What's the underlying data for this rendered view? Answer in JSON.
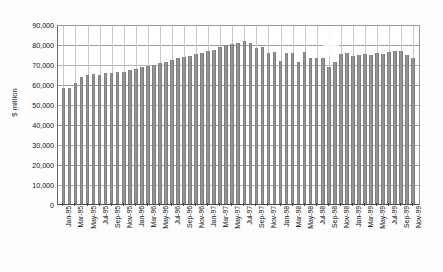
{
  "chart_data": {
    "type": "bar",
    "title": "",
    "xlabel": "",
    "ylabel": "$ million",
    "ylim": [
      0,
      90000
    ],
    "ytick_step": 10000,
    "ytick_labels": [
      "90,000",
      "80,000",
      "70,000",
      "60,000",
      "50,000",
      "40,000",
      "30,000",
      "20,000",
      "10,000",
      "0"
    ],
    "ytick_values": [
      90000,
      80000,
      70000,
      60000,
      50000,
      40000,
      30000,
      20000,
      10000,
      0
    ],
    "grid": true,
    "legend": "none",
    "xtick_interval_months": 2,
    "bar_color": "#8d8d8d",
    "categories": [
      "Jan-95",
      "Feb-95",
      "Mar-95",
      "Apr-95",
      "May-95",
      "Jun-95",
      "Jul-95",
      "Aug-95",
      "Sep-95",
      "Oct-95",
      "Nov-95",
      "Dec-95",
      "Jan-96",
      "Feb-96",
      "Mar-96",
      "Apr-96",
      "May-96",
      "Jun-96",
      "Jul-96",
      "Aug-96",
      "Sep-96",
      "Oct-96",
      "Nov-96",
      "Dec-96",
      "Jan-97",
      "Feb-97",
      "Mar-97",
      "Apr-97",
      "May-97",
      "Jun-97",
      "Jul-97",
      "Aug-97",
      "Sep-97",
      "Oct-97",
      "Nov-97",
      "Dec-97",
      "Jan-98",
      "Feb-98",
      "Mar-98",
      "Apr-98",
      "May-98",
      "Jun-98",
      "Jul-98",
      "Aug-98",
      "Sep-98",
      "Oct-98",
      "Nov-98",
      "Dec-98",
      "Jan-99",
      "Feb-99",
      "Mar-99",
      "Apr-99",
      "May-99",
      "Jun-99",
      "Jul-99",
      "Aug-99",
      "Sep-99",
      "Oct-99",
      "Nov-99"
    ],
    "xtick_labels": [
      "Jan-95",
      "Mar-95",
      "May-95",
      "Jul-95",
      "Sep-95",
      "Nov-95",
      "Jan-96",
      "Mar-96",
      "May-96",
      "Jul-96",
      "Sep-96",
      "Nov-96",
      "Jan-97",
      "Mar-97",
      "May-97",
      "Jul-97",
      "Sep-97",
      "Nov-97",
      "Jan-98",
      "Mar-98",
      "May-98",
      "Jul-98",
      "Sep-98",
      "Nov-98",
      "Jan-99",
      "Mar-99",
      "May-99",
      "Jul-99",
      "Sep-99",
      "Nov-99"
    ],
    "values": [
      58000,
      58000,
      60500,
      63500,
      64500,
      65000,
      64500,
      65500,
      65500,
      66000,
      66000,
      67000,
      67500,
      68500,
      69000,
      69500,
      70500,
      71000,
      72000,
      73000,
      73500,
      74000,
      75000,
      75500,
      76500,
      77000,
      78500,
      79500,
      80000,
      80500,
      81500,
      80500,
      78000,
      78500,
      75500,
      76000,
      71500,
      75500,
      75500,
      71000,
      76000,
      73000,
      73000,
      73000,
      68500,
      71000,
      75000,
      75500,
      74000,
      74500,
      75000,
      74500,
      75500,
      75000,
      76000,
      76500,
      76500,
      74500,
      73000
    ]
  }
}
